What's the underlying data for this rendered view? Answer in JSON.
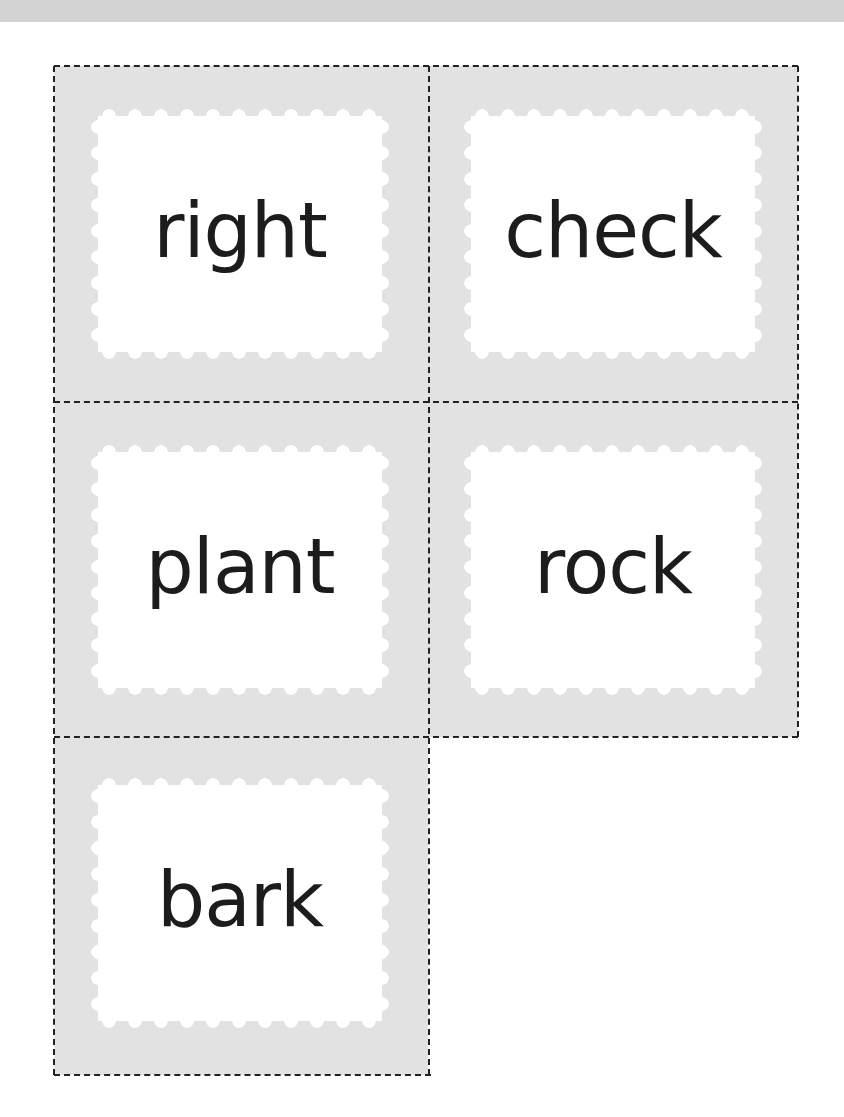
{
  "page": {
    "top_band_color": "#d2d2d2",
    "card_fill_color": "#e2e2e2",
    "stamp_color": "#ffffff",
    "cut_line_style": "dashed"
  },
  "cards": [
    {
      "word": "right",
      "row": 1,
      "col": 1
    },
    {
      "word": "check",
      "row": 1,
      "col": 2
    },
    {
      "word": "plant",
      "row": 2,
      "col": 1
    },
    {
      "word": "rock",
      "row": 2,
      "col": 2
    },
    {
      "word": "bark",
      "row": 3,
      "col": 1
    }
  ]
}
